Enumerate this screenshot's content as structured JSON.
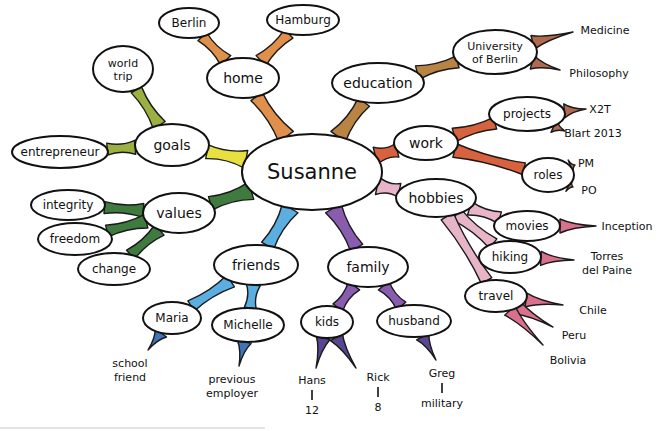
{
  "colors": {
    "home": "#e0904a",
    "education": "#b98344",
    "work": "#d9623e",
    "work_leaf": "#b06a50",
    "hobbies": "#e8b4c8",
    "hobbies_leaf": "#d9708c",
    "family": "#8a5cb0",
    "family_leaf": "#5a4590",
    "friends": "#5aaee0",
    "friends_leaf": "#3f74b8",
    "values": "#3f7a3f",
    "values_leaf": "#3f6a48",
    "goals": "#e8e040",
    "goals_leaf": "#9ab040"
  },
  "center": {
    "label": "Susanne",
    "x": 312,
    "y": 172,
    "rx": 70,
    "ry": 38
  },
  "nodes": [
    {
      "id": "home",
      "label": "home",
      "x": 243,
      "y": 78,
      "rx": 36,
      "ry": 20,
      "color": "#e0904a"
    },
    {
      "id": "berlin",
      "label": "Berlin",
      "x": 189,
      "y": 23,
      "rx": 30,
      "ry": 15,
      "color": "#e0904a",
      "parent": "home"
    },
    {
      "id": "hamburg",
      "label": "Hamburg",
      "x": 303,
      "y": 20,
      "rx": 36,
      "ry": 15,
      "color": "#e0904a",
      "parent": "home"
    },
    {
      "id": "education",
      "label": "education",
      "x": 378,
      "y": 83,
      "rx": 46,
      "ry": 20,
      "color": "#b98344"
    },
    {
      "id": "university",
      "label": "University|of Berlin",
      "x": 495,
      "y": 52,
      "rx": 42,
      "ry": 22,
      "color": "#b98344",
      "parent": "education"
    },
    {
      "id": "work",
      "label": "work",
      "x": 426,
      "y": 143,
      "rx": 32,
      "ry": 17,
      "color": "#d9623e"
    },
    {
      "id": "projects",
      "label": "projects",
      "x": 527,
      "y": 114,
      "rx": 38,
      "ry": 17,
      "color": "#d9623e",
      "parent": "work"
    },
    {
      "id": "roles",
      "label": "roles",
      "x": 548,
      "y": 175,
      "rx": 26,
      "ry": 17,
      "color": "#d9623e",
      "parent": "work"
    },
    {
      "id": "hobbies",
      "label": "hobbies",
      "x": 436,
      "y": 198,
      "rx": 40,
      "ry": 19,
      "color": "#e8b4c8"
    },
    {
      "id": "movies",
      "label": "movies",
      "x": 527,
      "y": 226,
      "rx": 33,
      "ry": 15,
      "color": "#e8b4c8",
      "parent": "hobbies"
    },
    {
      "id": "hiking",
      "label": "hiking",
      "x": 510,
      "y": 257,
      "rx": 31,
      "ry": 16,
      "color": "#e8b4c8",
      "parent": "hobbies"
    },
    {
      "id": "travel",
      "label": "travel",
      "x": 496,
      "y": 296,
      "rx": 31,
      "ry": 16,
      "color": "#e8b4c8",
      "parent": "hobbies"
    },
    {
      "id": "family",
      "label": "family",
      "x": 368,
      "y": 267,
      "rx": 40,
      "ry": 20,
      "color": "#8a5cb0"
    },
    {
      "id": "kids",
      "label": "kids",
      "x": 327,
      "y": 322,
      "rx": 26,
      "ry": 16,
      "color": "#8a5cb0",
      "parent": "family"
    },
    {
      "id": "husband",
      "label": "husband",
      "x": 414,
      "y": 321,
      "rx": 37,
      "ry": 16,
      "color": "#8a5cb0",
      "parent": "family"
    },
    {
      "id": "friends",
      "label": "friends",
      "x": 256,
      "y": 265,
      "rx": 42,
      "ry": 20,
      "color": "#5aaee0"
    },
    {
      "id": "maria",
      "label": "Maria",
      "x": 172,
      "y": 318,
      "rx": 29,
      "ry": 16,
      "color": "#5aaee0",
      "parent": "friends"
    },
    {
      "id": "michelle",
      "label": "Michelle",
      "x": 248,
      "y": 325,
      "rx": 36,
      "ry": 17,
      "color": "#5aaee0",
      "parent": "friends"
    },
    {
      "id": "values",
      "label": "values",
      "x": 179,
      "y": 213,
      "rx": 36,
      "ry": 20,
      "color": "#3f7a3f"
    },
    {
      "id": "integrity",
      "label": "integrity",
      "x": 68,
      "y": 205,
      "rx": 37,
      "ry": 15,
      "color": "#3f7a3f",
      "parent": "values"
    },
    {
      "id": "freedom",
      "label": "freedom",
      "x": 75,
      "y": 239,
      "rx": 37,
      "ry": 16,
      "color": "#3f7a3f",
      "parent": "values"
    },
    {
      "id": "change",
      "label": "change",
      "x": 114,
      "y": 269,
      "rx": 36,
      "ry": 16,
      "color": "#3f7a3f",
      "parent": "values"
    },
    {
      "id": "goals",
      "label": "goals",
      "x": 172,
      "y": 145,
      "rx": 37,
      "ry": 21,
      "color": "#e8e040"
    },
    {
      "id": "worldtrip",
      "label": "world|trip",
      "x": 123,
      "y": 69,
      "rx": 30,
      "ry": 23,
      "color": "#9ab040",
      "parent": "goals"
    },
    {
      "id": "entrepreneur",
      "label": "entrepreneur",
      "x": 60,
      "y": 152,
      "rx": 48,
      "ry": 16,
      "color": "#9ab040",
      "parent": "goals"
    }
  ],
  "leaves": [
    {
      "label": "Medicine",
      "x": 605,
      "y": 30,
      "from": "university",
      "tip": [
        573,
        32
      ],
      "color": "#b06a50"
    },
    {
      "label": "Philosophy",
      "x": 599,
      "y": 73,
      "from": "university",
      "tip": [
        560,
        70
      ],
      "color": "#b06a50"
    },
    {
      "label": "X2T",
      "x": 600,
      "y": 109,
      "from": "projects",
      "tip": [
        586,
        109
      ],
      "color": "#b06a50"
    },
    {
      "label": "Blart 2013",
      "x": 593,
      "y": 133,
      "from": "projects",
      "tip": [
        565,
        131
      ],
      "color": "#b06a50"
    },
    {
      "label": "PM",
      "x": 586,
      "y": 163,
      "from": "roles",
      "tip": [
        575,
        165
      ],
      "color": "#b06a50"
    },
    {
      "label": "PO",
      "x": 589,
      "y": 190,
      "from": "roles",
      "tip": [
        573,
        187
      ],
      "color": "#b06a50"
    },
    {
      "label": "Inception",
      "x": 627,
      "y": 226,
      "from": "movies",
      "tip": [
        596,
        226
      ],
      "color": "#d9708c"
    },
    {
      "label": "Torres|del Paine",
      "x": 607,
      "y": 263,
      "from": "hiking",
      "tip": [
        574,
        260
      ],
      "color": "#d9708c"
    },
    {
      "label": "Chile",
      "x": 593,
      "y": 310,
      "from": "travel",
      "tip": [
        563,
        305
      ],
      "color": "#d9708c"
    },
    {
      "label": "Peru",
      "x": 574,
      "y": 335,
      "from": "travel",
      "tip": [
        553,
        327
      ],
      "color": "#d9708c"
    },
    {
      "label": "Bolivia",
      "x": 568,
      "y": 360,
      "from": "travel",
      "tip": [
        543,
        345
      ],
      "color": "#d9708c"
    },
    {
      "label": "Hans",
      "x": 312,
      "y": 380,
      "from": "kids",
      "tip": [
        316,
        368
      ],
      "color": "#5a4590",
      "sub": "12"
    },
    {
      "label": "Rick",
      "x": 378,
      "y": 377,
      "from": "kids",
      "tip": [
        356,
        368
      ],
      "color": "#5a4590",
      "sub": "8"
    },
    {
      "label": "Greg",
      "x": 442,
      "y": 373,
      "from": "husband",
      "tip": [
        436,
        360
      ],
      "color": "#5a4590",
      "sub": "military"
    },
    {
      "label": "school|friend",
      "x": 130,
      "y": 370,
      "from": "maria",
      "tip": [
        148,
        350
      ],
      "color": "#3f74b8"
    },
    {
      "label": "previous|employer",
      "x": 232,
      "y": 386,
      "from": "michelle",
      "tip": [
        239,
        366
      ],
      "color": "#3f74b8"
    }
  ]
}
